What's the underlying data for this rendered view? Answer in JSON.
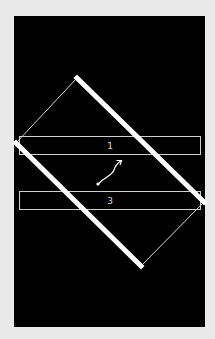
{
  "scene": {
    "background_color": "#e9e9e9",
    "canvas_color": "#000000",
    "stroke_color": "#ffffff",
    "boxes": [
      {
        "label": "1"
      },
      {
        "label": "3"
      }
    ],
    "rotated_rectangle": {
      "vertices": [
        [
          77,
          78
        ],
        [
          204,
          202
        ],
        [
          141,
          266
        ],
        [
          16,
          143
        ]
      ],
      "thick_edges": [
        "top-right",
        "bottom-left"
      ],
      "thin_edges": [
        "top-left",
        "bottom-right"
      ]
    },
    "arrow": {
      "from": [
        98,
        184
      ],
      "to": [
        121,
        161
      ]
    }
  }
}
